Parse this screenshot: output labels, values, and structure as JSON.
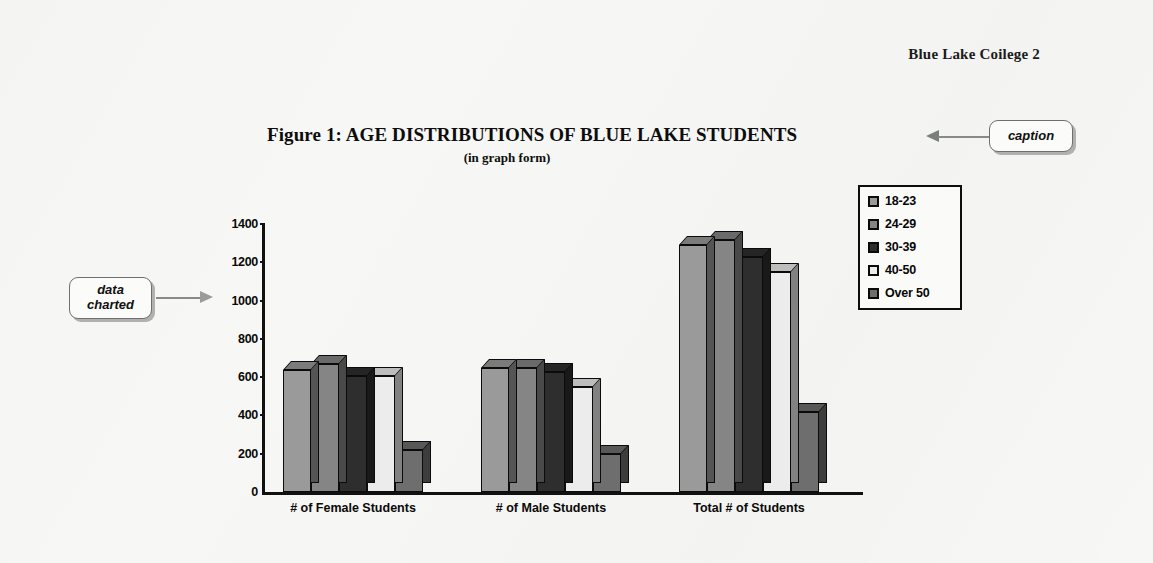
{
  "page": {
    "running_head": "Blue Lake Coilege 2",
    "background_color": "#f7f7f5"
  },
  "callouts": [
    {
      "id": "caption",
      "label": "caption"
    },
    {
      "id": "data-charted",
      "label_line1": "data",
      "label_line2": "charted"
    }
  ],
  "chart_data": {
    "type": "bar",
    "title": "Figure 1: AGE DISTRIBUTIONS OF BLUE LAKE STUDENTS",
    "subtitle": "(in graph form)",
    "xlabel": "",
    "ylabel": "",
    "ylim": [
      0,
      1400
    ],
    "ytick_values": [
      0,
      200,
      400,
      600,
      800,
      1000,
      1200,
      1400
    ],
    "ytick_labels": [
      "0",
      "200",
      "400",
      "600",
      "800",
      "1000",
      "1200",
      "1400"
    ],
    "grid": false,
    "legend_position": "top-right",
    "categories": [
      "# of Female Students",
      "# of Male Students",
      "Total # of Students"
    ],
    "series": [
      {
        "name": "18-23",
        "color": "#9a9a9a",
        "values": [
          635,
          650,
          1290
        ]
      },
      {
        "name": "24-29",
        "color": "#858585",
        "values": [
          670,
          650,
          1315
        ]
      },
      {
        "name": "30-39",
        "color": "#2e2e2e",
        "values": [
          605,
          625,
          1230
        ]
      },
      {
        "name": "40-50",
        "color": "#ececec",
        "values": [
          605,
          550,
          1150
        ]
      },
      {
        "name": "Over 50",
        "color": "#6e6e6e",
        "values": [
          220,
          200,
          420
        ]
      }
    ]
  }
}
